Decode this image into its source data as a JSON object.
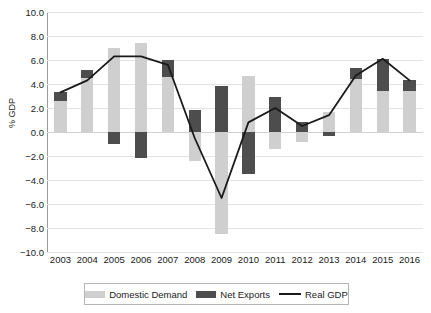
{
  "chart_data": {
    "type": "bar",
    "title": "",
    "subtitle": "",
    "xlabel": "",
    "ylabel": "% GDP",
    "categories": [
      "2003",
      "2004",
      "2005",
      "2006",
      "2007",
      "2008",
      "2009",
      "2010",
      "2011",
      "2012",
      "2013",
      "2014",
      "2015",
      "2016"
    ],
    "ylim": [
      -10.0,
      10.0
    ],
    "yticks": [
      10.0,
      8.0,
      6.0,
      4.0,
      2.0,
      0.0,
      -2.0,
      -4.0,
      -6.0,
      -8.0,
      -10.0
    ],
    "ytick_labels": [
      "10.0",
      "8.0",
      "6.0",
      "4.0",
      "2.0",
      "0.0",
      "-2.0",
      "-4.0",
      "-6.0",
      "-8.0",
      "-10.0"
    ],
    "grid": true,
    "legend_position": "bottom",
    "stacked": true,
    "series": [
      {
        "name": "Domestic Demand",
        "kind": "bar",
        "color": "#cfcfcf",
        "values": [
          2.6,
          4.5,
          7.0,
          7.4,
          4.6,
          -2.4,
          -8.5,
          4.7,
          -1.4,
          -0.8,
          1.7,
          4.4,
          3.4,
          3.4
        ]
      },
      {
        "name": "Net Exports",
        "kind": "bar",
        "color": "#4d4d4d",
        "values": [
          0.7,
          0.7,
          -1.0,
          -2.2,
          1.4,
          1.8,
          3.8,
          -3.5,
          2.9,
          0.8,
          -0.3,
          0.9,
          2.7,
          0.9
        ]
      },
      {
        "name": "Real GDP",
        "kind": "line",
        "color": "#1a1a1a",
        "values": [
          3.3,
          4.3,
          6.3,
          6.3,
          5.6,
          -0.5,
          -5.5,
          0.8,
          2.0,
          0.5,
          1.4,
          4.7,
          6.1,
          4.3
        ]
      }
    ]
  },
  "legend": {
    "items": [
      {
        "label": "Domestic Demand",
        "marker": "swatch-light-gray"
      },
      {
        "label": "Net Exports",
        "marker": "swatch-dark-gray"
      },
      {
        "label": "Real GDP",
        "marker": "line-black"
      }
    ]
  }
}
